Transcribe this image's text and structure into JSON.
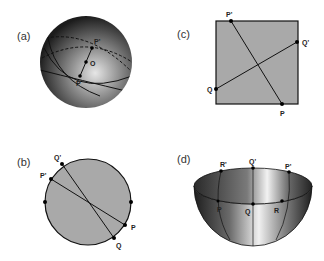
{
  "panels": {
    "a": {
      "label": "(a)",
      "points": {
        "p_prime": "P'",
        "o": "O",
        "p": "P"
      },
      "description": "sphere with great circles through antipodal points"
    },
    "b": {
      "label": "(b)",
      "points": {
        "q_prime": "Q'",
        "p_prime": "P'",
        "p": "P",
        "q": "Q"
      },
      "description": "disk with antipodal boundary points identified"
    },
    "c": {
      "label": "(c)",
      "points": {
        "p_prime": "P'",
        "q_prime": "Q'",
        "q": "Q",
        "p": "P"
      },
      "description": "square with opposite edges identified"
    },
    "d": {
      "label": "(d)",
      "points": {
        "r_prime": "R'",
        "q_prime": "Q'",
        "p_prime": "P'",
        "p": "P",
        "q": "Q",
        "r": "R"
      },
      "description": "hemisphere bowl with antipodal rim points identified"
    }
  },
  "colors": {
    "disk_fill": "#a9a9a9",
    "outline": "#111111",
    "sphere_light": "#e8e8e8",
    "sphere_dark": "#1a1a1a"
  }
}
